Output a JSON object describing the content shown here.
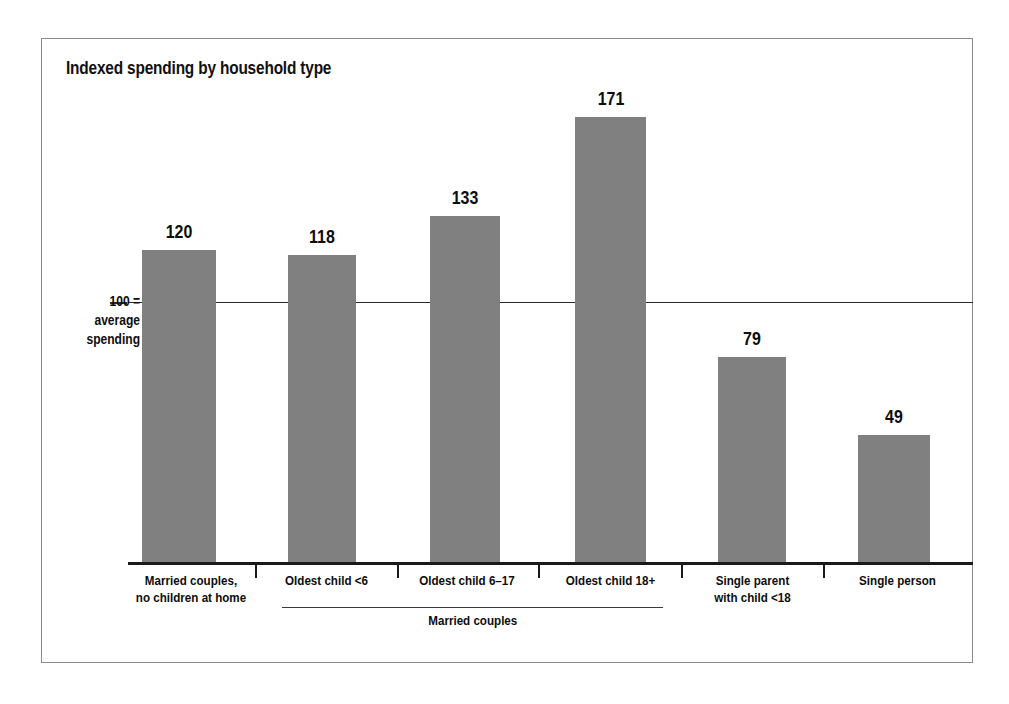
{
  "figure": {
    "title": "Indexed spending by household type",
    "reference_label_lines": [
      "100 =",
      "average",
      "spending"
    ],
    "group_label": "Married couples",
    "bar_color": "#808080",
    "axis_color": "#1a1a1a",
    "frame_color": "#8a8a8a",
    "text_color": "#0d0d0d"
  },
  "chart_data": {
    "type": "bar",
    "title": "Indexed spending by household type",
    "xlabel": "",
    "ylabel": "",
    "ylim": [
      0,
      180
    ],
    "grid": false,
    "legend": "none",
    "reference_line": {
      "value": 100,
      "label": "100 = average spending"
    },
    "categories": [
      "Married couples, no children at home",
      "Oldest child <6",
      "Oldest child 6–17",
      "Oldest child 18+",
      "Single parent with child <18",
      "Single person"
    ],
    "category_label_lines": [
      [
        "Married couples,",
        "no children at home"
      ],
      [
        "Oldest child <6"
      ],
      [
        "Oldest child 6–17"
      ],
      [
        "Oldest child 18+"
      ],
      [
        "Single parent",
        "with child <18"
      ],
      [
        "Single person"
      ]
    ],
    "values": [
      120,
      118,
      133,
      171,
      79,
      49
    ],
    "value_labels": [
      "120",
      "118",
      "133",
      "171",
      "79",
      "49"
    ],
    "groups": [
      {
        "label": "Married couples",
        "category_indices": [
          1,
          2,
          3
        ]
      }
    ]
  }
}
